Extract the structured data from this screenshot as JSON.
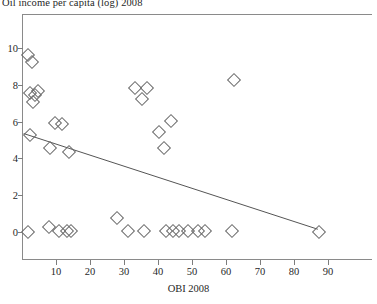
{
  "chart": {
    "title": "Oil income per capita (log) 2008",
    "xlabel": "OBI 2008",
    "ylabel": ""
  },
  "chart_data": {
    "type": "scatter",
    "title": "Oil income per capita (log) 2008",
    "xlabel": "OBI 2008",
    "ylabel": "Oil income per capita (log) 2008",
    "xlim": [
      0,
      100
    ],
    "ylim": [
      -0.6,
      10.8
    ],
    "xticks": [
      10,
      20,
      30,
      40,
      50,
      60,
      70,
      80,
      90
    ],
    "yticks": [
      0,
      2,
      4,
      6,
      8,
      10
    ],
    "grid": false,
    "legend": null,
    "marker": "diamond-open",
    "points": [
      {
        "x": 1.5,
        "y": 9.7
      },
      {
        "x": 2.5,
        "y": 9.3
      },
      {
        "x": 2.0,
        "y": 7.6
      },
      {
        "x": 3.5,
        "y": 7.5
      },
      {
        "x": 4.5,
        "y": 7.7
      },
      {
        "x": 3.0,
        "y": 7.1
      },
      {
        "x": 9.5,
        "y": 6.0
      },
      {
        "x": 11.5,
        "y": 5.9
      },
      {
        "x": 2.0,
        "y": 5.3
      },
      {
        "x": 8.0,
        "y": 4.6
      },
      {
        "x": 13.5,
        "y": 4.4
      },
      {
        "x": 33.0,
        "y": 7.9
      },
      {
        "x": 36.5,
        "y": 7.9
      },
      {
        "x": 35.0,
        "y": 7.3
      },
      {
        "x": 62.0,
        "y": 8.3
      },
      {
        "x": 43.5,
        "y": 6.1
      },
      {
        "x": 40.0,
        "y": 5.5
      },
      {
        "x": 41.5,
        "y": 4.6
      },
      {
        "x": 1.5,
        "y": 0.05
      },
      {
        "x": 7.5,
        "y": 0.35
      },
      {
        "x": 10.5,
        "y": 0.1
      },
      {
        "x": 13.0,
        "y": 0.1
      },
      {
        "x": 14.0,
        "y": 0.1
      },
      {
        "x": 27.5,
        "y": 0.8
      },
      {
        "x": 31.0,
        "y": 0.1
      },
      {
        "x": 35.5,
        "y": 0.1
      },
      {
        "x": 42.0,
        "y": 0.1
      },
      {
        "x": 44.0,
        "y": 0.1
      },
      {
        "x": 46.0,
        "y": 0.1
      },
      {
        "x": 48.5,
        "y": 0.1
      },
      {
        "x": 51.5,
        "y": 0.1
      },
      {
        "x": 53.5,
        "y": 0.1
      },
      {
        "x": 61.5,
        "y": 0.1
      },
      {
        "x": 87.0,
        "y": 0.05
      }
    ],
    "fit_line": {
      "x0": 0.5,
      "y0": 5.35,
      "x1": 87.0,
      "y1": 0.15
    }
  }
}
